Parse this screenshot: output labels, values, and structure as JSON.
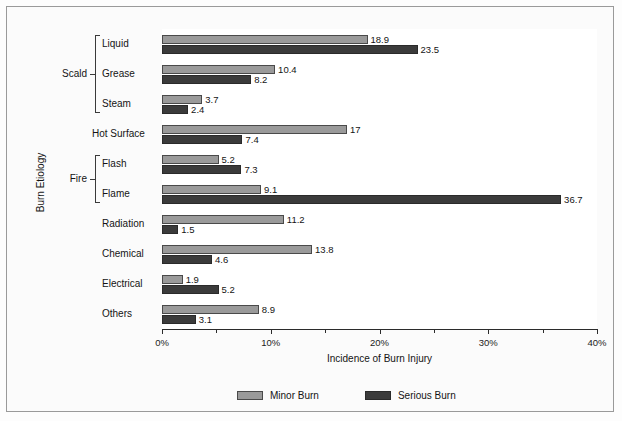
{
  "chart_data": {
    "type": "bar",
    "orientation": "horizontal",
    "title": "",
    "xlabel": "Incidence of Burn Injury",
    "ylabel": "Burn Etiology",
    "xlim": [
      0,
      40
    ],
    "xtick_labels": [
      "0%",
      "10%",
      "20%",
      "30%",
      "40%"
    ],
    "xtick_values": [
      0,
      10,
      20,
      30,
      40
    ],
    "minor_tick_values": [
      5,
      15,
      25,
      35
    ],
    "grid": false,
    "legend_position": "bottom",
    "categories": [
      "Liquid",
      "Grease",
      "Steam",
      "Hot Surface",
      "Flash",
      "Flame",
      "Radiation",
      "Chemical",
      "Electrical",
      "Others"
    ],
    "groups": [
      {
        "label": "Scald",
        "members": [
          "Liquid",
          "Grease",
          "Steam"
        ]
      },
      {
        "label": "Fire",
        "members": [
          "Flash",
          "Flame"
        ]
      }
    ],
    "series": [
      {
        "name": "Minor Burn",
        "color": "#9a9a9a",
        "values": [
          18.9,
          10.4,
          3.7,
          17,
          5.2,
          9.1,
          11.2,
          13.8,
          1.9,
          8.9
        ],
        "labels": [
          "18.9",
          "10.4",
          "3.7",
          "17",
          "5.2",
          "9.1",
          "11.2",
          "13.8",
          "1.9",
          "8.9"
        ]
      },
      {
        "name": "Serious Burn",
        "color": "#3b3b3b",
        "values": [
          23.5,
          8.2,
          2.4,
          7.4,
          7.3,
          36.7,
          1.5,
          4.6,
          5.2,
          3.1
        ],
        "labels": [
          "23.5",
          "8.2",
          "2.4",
          "7.4",
          "7.3",
          "36.7",
          "1.5",
          "4.6",
          "5.2",
          "3.1"
        ]
      }
    ]
  },
  "legend": {
    "items": [
      {
        "label": "Minor Burn",
        "swatch": "minor"
      },
      {
        "label": "Serious Burn",
        "swatch": "serious"
      }
    ]
  },
  "axes": {
    "x_title": "Incidence of Burn Injury",
    "y_title": "Burn Etiology"
  }
}
